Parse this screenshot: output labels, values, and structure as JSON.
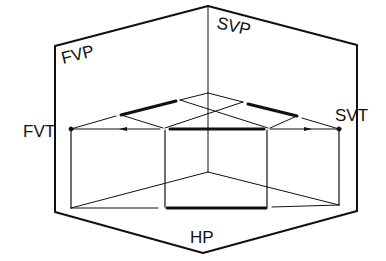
{
  "diagram": {
    "labels": {
      "fvp": "FVP",
      "svp": "SVP",
      "hp": "HP",
      "fvt": "FVT",
      "svt": "SVT"
    },
    "colors": {
      "stroke": "#111111",
      "background": "#ffffff"
    }
  }
}
